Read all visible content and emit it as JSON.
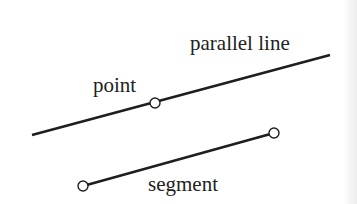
{
  "diagram": {
    "colors": {
      "background": "#ffffff",
      "stroke": "#1e1e1e",
      "text": "#222222",
      "point_fill": "#ffffff"
    },
    "elements": {
      "parallel_line": {
        "label": "parallel line",
        "x1": 32,
        "y1": 135,
        "x2": 330,
        "y2": 55
      },
      "point": {
        "label": "point",
        "cx": 155,
        "cy": 103,
        "r": 5
      },
      "segment": {
        "label": "segment",
        "x1": 83,
        "y1": 186,
        "x2": 274,
        "y2": 133,
        "endpoint_radius": 5
      }
    },
    "labels": {
      "parallel_line": {
        "text": "parallel line",
        "x": 190,
        "y": 50
      },
      "point": {
        "text": "point",
        "x": 93,
        "y": 92
      },
      "segment": {
        "text": "segment",
        "x": 148,
        "y": 191
      }
    }
  }
}
